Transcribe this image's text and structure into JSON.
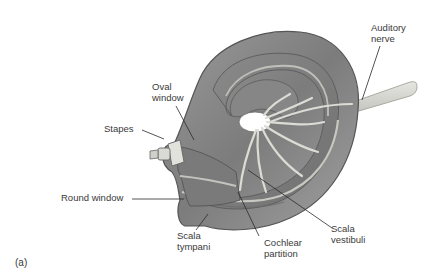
{
  "figure": {
    "panel_label": "(a)",
    "labels": {
      "auditory_nerve": "Auditory\nnerve",
      "oval_window": "Oval\nwindow",
      "stapes": "Stapes",
      "round_window": "Round window",
      "scala_tympani": "Scala\ntympani",
      "cochlear_partition": "Cochlear\npartition",
      "scala_vestibuli": "Scala\nvestibuli"
    },
    "colors": {
      "cochlea_fill": "#8c8c8c",
      "cochlea_outline": "#5a5a5a",
      "nerve_fill": "#d8d8d2",
      "leader_line": "#2a2a2a",
      "label_text": "#3a3a3a"
    }
  }
}
